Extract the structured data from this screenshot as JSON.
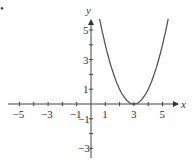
{
  "chart_data": {
    "type": "line",
    "title": "",
    "function": "y = (x - 3)^2",
    "series": [
      {
        "name": "y=(x-3)^2",
        "x": [
          0.6,
          1,
          1.5,
          2,
          2.5,
          3,
          3.5,
          4,
          4.5,
          5,
          5.4
        ],
        "values": [
          5.76,
          4,
          2.25,
          1,
          0.25,
          0,
          0.25,
          1,
          2.25,
          4,
          5.76
        ]
      }
    ],
    "xlabel": "x",
    "ylabel": "y",
    "x_ticks": [
      "−5",
      "−3",
      "−1",
      "1",
      "3",
      "5"
    ],
    "y_ticks": [
      "5",
      "3",
      "1",
      "−1",
      "−3"
    ],
    "xlim": [
      -5.8,
      5.8
    ],
    "ylim": [
      -3.5,
      5.8
    ],
    "grid": false,
    "legend": "none"
  },
  "labels": {
    "x": "x",
    "y": "y",
    "dot": "•"
  }
}
